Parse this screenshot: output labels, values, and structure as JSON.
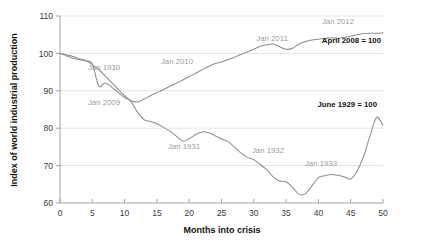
{
  "chart_data": {
    "type": "line",
    "title": "",
    "xlabel": "Months into crisis",
    "ylabel": "Index of world industrial production",
    "xlim": [
      0,
      50
    ],
    "ylim": [
      60,
      110
    ],
    "xticks": [
      "0",
      "5",
      "10",
      "15",
      "20",
      "25",
      "30",
      "35",
      "40",
      "45",
      "50"
    ],
    "yticks": [
      "60",
      "70",
      "80",
      "90",
      "100",
      "110"
    ],
    "grid": "horizontal",
    "legend_position": "inline-annotations",
    "series": [
      {
        "name": "June 1929 = 100",
        "color": "#8d8d8d",
        "x": [
          0,
          1,
          2,
          3,
          4,
          5,
          6,
          7,
          8,
          9,
          10,
          11,
          12,
          13,
          14,
          15,
          16,
          17,
          18,
          19,
          20,
          21,
          22,
          23,
          24,
          25,
          26,
          27,
          28,
          29,
          30,
          31,
          32,
          33,
          34,
          35,
          36,
          37,
          38,
          39,
          40,
          41,
          42,
          43,
          44,
          45,
          46,
          47,
          48,
          49,
          50
        ],
        "y": [
          100,
          99.6,
          99.2,
          98.6,
          98.0,
          97.0,
          95.7,
          94.0,
          92.2,
          90.4,
          88.7,
          87.1,
          84.3,
          82.3,
          81.8,
          81.2,
          80.3,
          79.2,
          77.9,
          76.6,
          77.2,
          78.3,
          79.0,
          78.8,
          78.0,
          77.1,
          76.4,
          75.0,
          73.4,
          72.2,
          71.6,
          70.3,
          68.9,
          67.0,
          65.9,
          65.7,
          64.2,
          62.3,
          62.5,
          64.6,
          66.8,
          67.3,
          67.6,
          67.4,
          67.0,
          66.4,
          68.6,
          72.5,
          78.0,
          82.9,
          80.8
        ]
      },
      {
        "name": "April 2008 = 100",
        "color": "#8d8d8d",
        "x": [
          0,
          1,
          2,
          3,
          4,
          5,
          6,
          7,
          8,
          9,
          10,
          11,
          12,
          13,
          14,
          15,
          16,
          17,
          18,
          19,
          20,
          21,
          22,
          23,
          24,
          25,
          26,
          27,
          28,
          29,
          30,
          31,
          32,
          33,
          34,
          35,
          36,
          37,
          38,
          39,
          40,
          41,
          42,
          43,
          44,
          45,
          46,
          47,
          48,
          49,
          50
        ],
        "y": [
          100,
          99.4,
          98.7,
          98.3,
          98.0,
          97.2,
          91.3,
          92.1,
          91.0,
          89.6,
          88.2,
          87.4,
          87.0,
          87.8,
          88.7,
          89.5,
          90.3,
          91.2,
          92.0,
          92.9,
          93.8,
          94.7,
          95.6,
          96.5,
          97.3,
          97.7,
          98.3,
          99.0,
          99.7,
          100.4,
          101.1,
          101.9,
          102.3,
          102.5,
          101.8,
          101.1,
          101.4,
          102.5,
          103.2,
          103.6,
          103.8,
          104.0,
          104.2,
          104.0,
          104.3,
          104.6,
          105.0,
          105.3,
          105.4,
          105.4,
          105.5
        ]
      }
    ],
    "annotations": [
      {
        "text": "Jan 1930",
        "x_px": 104,
        "y_px": 70,
        "style": "grey"
      },
      {
        "text": "Jan 2009",
        "x_px": 104,
        "y_px": 105,
        "style": "grey"
      },
      {
        "text": "Jan 2010",
        "x_px": 177,
        "y_px": 64,
        "style": "grey"
      },
      {
        "text": "Jan 2011",
        "x_px": 272,
        "y_px": 41,
        "style": "grey"
      },
      {
        "text": "Jan 2012",
        "x_px": 354,
        "y_px": 24,
        "style": "grey"
      },
      {
        "text": "April 2008 = 100",
        "x_px": 381,
        "y_px": 43,
        "style": "bold"
      },
      {
        "text": "Jan 1931",
        "x_px": 184,
        "y_px": 149,
        "style": "grey"
      },
      {
        "text": "Jan 1932",
        "x_px": 268,
        "y_px": 153,
        "style": "grey"
      },
      {
        "text": "Jan 1933",
        "x_px": 321,
        "y_px": 166,
        "style": "grey"
      },
      {
        "text": "June 1929 = 100",
        "x_px": 377,
        "y_px": 107,
        "style": "bold"
      }
    ]
  }
}
